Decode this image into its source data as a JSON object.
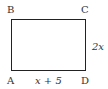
{
  "diagram": {
    "shape": "rectangle",
    "vertices": {
      "top_left": "B",
      "top_right": "C",
      "bottom_left": "A",
      "bottom_right": "D"
    },
    "side_labels": {
      "bottom": "x + 5",
      "right": "2x"
    },
    "colors": {
      "stroke": "#222222",
      "text": "#333333",
      "background": "#ffffff"
    }
  }
}
